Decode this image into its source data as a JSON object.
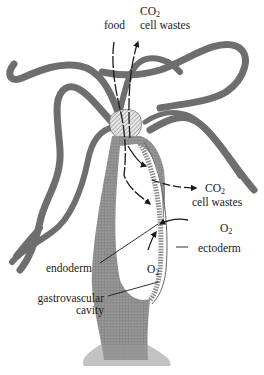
{
  "diagram": {
    "colors": {
      "tentacle_fill": "#6e6e6e",
      "body_fill": "#7a7a7a",
      "arrow": "#1a1a1a",
      "background": "#ffffff"
    },
    "labels": {
      "top_co2": "CO",
      "top_co2_sub": "2",
      "top_food": "food",
      "top_cell_wastes": "cell wastes",
      "right_co2": "CO",
      "right_co2_sub": "2",
      "right_cell_wastes": "cell wastes",
      "right_o2": "O",
      "right_o2_sub": "2",
      "ectoderm": "ectoderm",
      "endoderm": "endoderm",
      "inner_o2": "O",
      "inner_o2_sub": "2",
      "gastrovascular_line1": "gastrovascular",
      "gastrovascular_line2": "cavity"
    },
    "arrows": [
      {
        "from": "food",
        "to": "gastrovascular cavity",
        "direction": "down"
      },
      {
        "from": "mouth",
        "to": "CO2 / cell wastes (top)",
        "direction": "up"
      },
      {
        "from": "cell wall",
        "to": "CO2 / cell wastes (right)",
        "direction": "out"
      },
      {
        "from": "O2 (right)",
        "to": "ectoderm",
        "direction": "in"
      },
      {
        "from": "O2 (inner)",
        "to": "endoderm",
        "direction": "in"
      }
    ]
  }
}
